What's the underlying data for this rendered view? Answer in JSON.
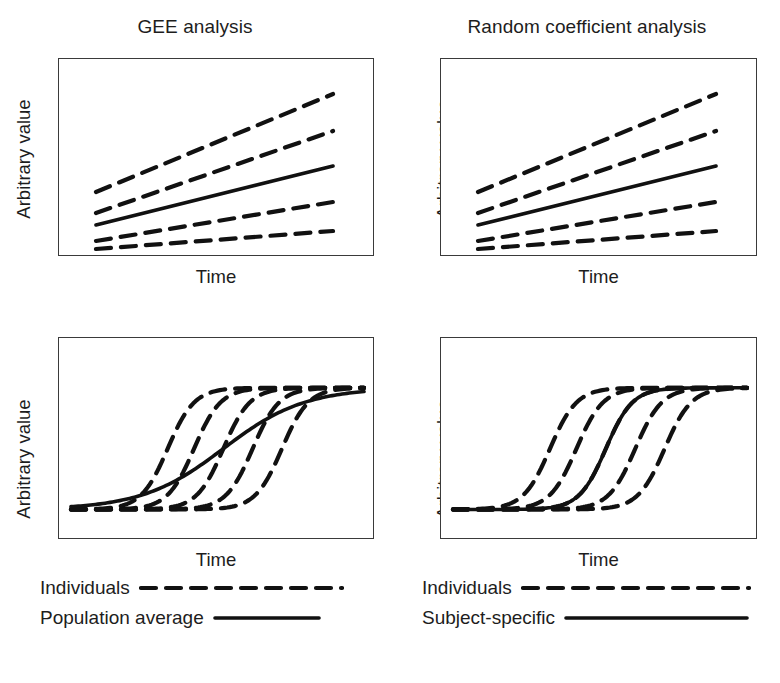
{
  "figure": {
    "caption_context": "Comparison of population-average (GEE) and subject-specific (random coefficient) model estimates for linear and non-linear outcomes",
    "line_color": "#111111",
    "frame_color": "#3a3a3a",
    "background": "#ffffff"
  },
  "panels": [
    {
      "id": "gee-linear",
      "title": "GEE analysis",
      "xlabel": "Time",
      "ylabel": "Arbitrary value",
      "curve_shape": "linear",
      "average_line_name": "Population average"
    },
    {
      "id": "random-coefficient-linear",
      "title": "Random coefficient analysis",
      "xlabel": "Time",
      "ylabel": "Arbitrary value",
      "curve_shape": "linear",
      "average_line_name": "Subject-specific"
    },
    {
      "id": "gee-sigmoid",
      "title": "",
      "xlabel": "Time",
      "ylabel": "Arbitrary value",
      "curve_shape": "sigmoid",
      "average_line_name": "Population average"
    },
    {
      "id": "random-coefficient-sigmoid",
      "title": "",
      "xlabel": "Time",
      "ylabel": "Arbitrary value",
      "curve_shape": "sigmoid",
      "average_line_name": "Subject-specific"
    }
  ],
  "legends": [
    {
      "id": "legend-left",
      "rows": [
        {
          "label": "Individuals",
          "style": "dashed"
        },
        {
          "label": "Population average",
          "style": "solid"
        }
      ]
    },
    {
      "id": "legend-right",
      "rows": [
        {
          "label": "Individuals",
          "style": "dashed"
        },
        {
          "label": "Subject-specific",
          "style": "solid"
        }
      ]
    }
  ],
  "chart_data": [
    {
      "type": "line",
      "panel": "gee-linear",
      "title": "GEE analysis",
      "xlabel": "Time",
      "ylabel": "Arbitrary value",
      "xlim": [
        0,
        100
      ],
      "ylim": [
        0,
        100
      ],
      "grid": false,
      "axis_ticks": false,
      "legend_position": "below-figure",
      "note": "Individual subject trajectories are straight lines with differing intercepts and slopes; the population-average line lies in the middle and has the average slope. For a linear model the population-average and subject-specific estimates are identical.",
      "series": [
        {
          "name": "Individual 1",
          "style": "dashed",
          "x": [
            12,
            87
          ],
          "y": [
            52,
            88
          ]
        },
        {
          "name": "Individual 2",
          "style": "dashed",
          "x": [
            12,
            87
          ],
          "y": [
            41,
            70
          ]
        },
        {
          "name": "Population average",
          "style": "solid",
          "x": [
            12,
            87
          ],
          "y": [
            35,
            53
          ]
        },
        {
          "name": "Individual 3",
          "style": "dashed",
          "x": [
            12,
            87
          ],
          "y": [
            26,
            35
          ]
        },
        {
          "name": "Individual 4",
          "style": "dashed",
          "x": [
            12,
            87
          ],
          "y": [
            22,
            20
          ]
        }
      ]
    },
    {
      "type": "line",
      "panel": "random-coefficient-linear",
      "title": "Random coefficient analysis",
      "xlabel": "Time",
      "ylabel": "Arbitrary value",
      "xlim": [
        0,
        100
      ],
      "ylim": [
        0,
        100
      ],
      "grid": false,
      "axis_ticks": false,
      "legend_position": "below-figure",
      "note": "Identical to the GEE panel: with a linear link the subject-specific average coincides with the population average.",
      "series": [
        {
          "name": "Individual 1",
          "style": "dashed",
          "x": [
            12,
            87
          ],
          "y": [
            52,
            88
          ]
        },
        {
          "name": "Individual 2",
          "style": "dashed",
          "x": [
            12,
            87
          ],
          "y": [
            41,
            70
          ]
        },
        {
          "name": "Subject-specific",
          "style": "solid",
          "x": [
            12,
            87
          ],
          "y": [
            35,
            53
          ]
        },
        {
          "name": "Individual 3",
          "style": "dashed",
          "x": [
            12,
            87
          ],
          "y": [
            26,
            35
          ]
        },
        {
          "name": "Individual 4",
          "style": "dashed",
          "x": [
            12,
            87
          ],
          "y": [
            22,
            20
          ]
        }
      ]
    },
    {
      "type": "line",
      "panel": "gee-sigmoid",
      "title": "",
      "xlabel": "Time",
      "ylabel": "Arbitrary value",
      "xlim": [
        0,
        100
      ],
      "ylim": [
        0,
        100
      ],
      "grid": false,
      "axis_ticks": false,
      "legend_position": "below-panel",
      "note": "Five individual sigmoid curves share the same steep slope but differ in the timing of the transition. The solid population-average curve, obtained by averaging across subjects at each time point, is markedly FLATTER (attenuated) than any individual curve.",
      "sigmoid_params": {
        "individuals": [
          {
            "name": "Individual 1",
            "midpoint": 33,
            "steepness": 0.22,
            "low": 8,
            "high": 80
          },
          {
            "name": "Individual 2",
            "midpoint": 42,
            "steepness": 0.22,
            "low": 8,
            "high": 80
          },
          {
            "name": "Individual 3",
            "midpoint": 52,
            "steepness": 0.22,
            "low": 8,
            "high": 80
          },
          {
            "name": "Individual 4",
            "midpoint": 62,
            "steepness": 0.22,
            "low": 8,
            "high": 80
          },
          {
            "name": "Individual 5",
            "midpoint": 72,
            "steepness": 0.22,
            "low": 8,
            "high": 80
          }
        ],
        "average": {
          "name": "Population average",
          "midpoint": 52,
          "steepness": 0.072,
          "low": 8,
          "high": 80
        }
      }
    },
    {
      "type": "line",
      "panel": "random-coefficient-sigmoid",
      "title": "",
      "xlabel": "Time",
      "ylabel": "Arbitrary value",
      "xlim": [
        0,
        100
      ],
      "ylim": [
        0,
        100
      ],
      "grid": false,
      "axis_ticks": false,
      "legend_position": "below-panel",
      "note": "The same five individual sigmoid curves. The solid subject-specific curve keeps the STEEP individual slope and sits at the median transition time, i.e. it describes a typical subject rather than the attenuated average.",
      "sigmoid_params": {
        "individuals": [
          {
            "name": "Individual 1",
            "midpoint": 33,
            "steepness": 0.22,
            "low": 8,
            "high": 80
          },
          {
            "name": "Individual 2",
            "midpoint": 42,
            "steepness": 0.22,
            "low": 8,
            "high": 80
          },
          {
            "name": "Individual 3",
            "midpoint": 52,
            "steepness": 0.22,
            "low": 8,
            "high": 80
          },
          {
            "name": "Individual 4",
            "midpoint": 62,
            "steepness": 0.22,
            "low": 8,
            "high": 80
          },
          {
            "name": "Individual 5",
            "midpoint": 72,
            "steepness": 0.22,
            "low": 8,
            "high": 80
          }
        ],
        "average": {
          "name": "Subject-specific",
          "midpoint": 52,
          "steepness": 0.22,
          "low": 8,
          "high": 80
        }
      }
    }
  ]
}
